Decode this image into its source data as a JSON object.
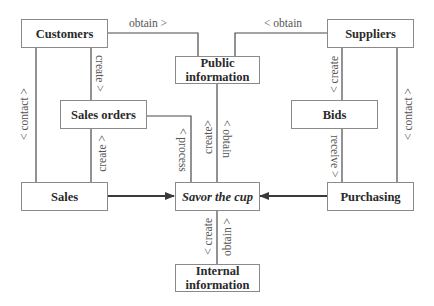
{
  "diagram": {
    "nodes": {
      "customers": "Customers",
      "suppliers": "Suppliers",
      "public_information": "Public information",
      "public_information_line1": "Public",
      "public_information_line2": "information",
      "sales_orders": "Sales orders",
      "bids": "Bids",
      "sales": "Sales",
      "savor_the_cup": "Savor the cup",
      "purchasing": "Purchasing",
      "internal_information_line1": "Internal",
      "internal_information_line2": "information"
    },
    "edges": [
      {
        "from": "Customers",
        "to": "Public information",
        "label": "obtain >"
      },
      {
        "from": "Suppliers",
        "to": "Public information",
        "label": "< obtain"
      },
      {
        "from": "Customers",
        "to": "Sales orders",
        "label": "create >"
      },
      {
        "from": "Customers",
        "to": "Sales",
        "label": "< contact >"
      },
      {
        "from": "Sales orders",
        "to": "Sales",
        "label": "create >"
      },
      {
        "from": "Sales orders",
        "to": "Savor the cup",
        "label": "< process"
      },
      {
        "from": "Public information",
        "to": "Savor the cup",
        "label": "create>"
      },
      {
        "from": "Public information",
        "to": "Savor the cup",
        "label": "< obtain"
      },
      {
        "from": "Suppliers",
        "to": "Bids",
        "label": "< create"
      },
      {
        "from": "Suppliers",
        "to": "Purchasing",
        "label": "< contact >"
      },
      {
        "from": "Bids",
        "to": "Purchasing",
        "label": "receive >"
      },
      {
        "from": "Sales",
        "to": "Savor the cup",
        "label": "",
        "arrow": true
      },
      {
        "from": "Purchasing",
        "to": "Savor the cup",
        "label": "",
        "arrow": true
      },
      {
        "from": "Savor the cup",
        "to": "Internal information",
        "label": "< create"
      },
      {
        "from": "Savor the cup",
        "to": "Internal information",
        "label": "obtain >"
      }
    ],
    "labels": {
      "cust_pub": "obtain >",
      "supp_pub": "< obtain",
      "cust_so": "create >",
      "cust_sales": "< contact >",
      "so_sales": "create >",
      "so_savor": "< process",
      "pub_savor_create": "create>",
      "pub_savor_obtain": "< obtain",
      "supp_bids": "< create",
      "supp_purch": "< contact >",
      "bids_purch": "receive >",
      "savor_int_create": "< create",
      "savor_int_obtain": "obtain >"
    },
    "colors": {
      "line": "#4a4a4a",
      "border": "#8a8a8a",
      "text": "#2a2a2a",
      "label": "#555555"
    }
  }
}
